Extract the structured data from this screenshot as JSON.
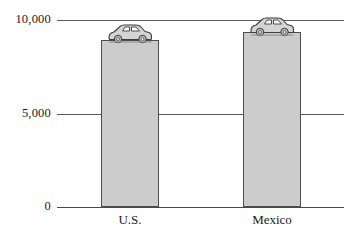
{
  "chart_data": {
    "type": "bar",
    "title": "",
    "subtitle": "",
    "xlabel": "",
    "ylabel": "",
    "categories": [
      "U.S.",
      "Mexico"
    ],
    "values": [
      8950,
      9350
    ],
    "series": [
      {
        "name": "",
        "values": [
          8950,
          9350
        ]
      }
    ],
    "ylim": [
      0,
      10000
    ],
    "yticks": [
      0,
      5000,
      10000
    ],
    "ytick_labels": [
      "0",
      "5,000",
      "10,000"
    ],
    "grid": true,
    "grid_axis": "y",
    "legend": false,
    "legend_position": "none",
    "annotations": [
      {
        "category": "U.S.",
        "icon": "car-icon"
      },
      {
        "category": "Mexico",
        "icon": "car-icon"
      }
    ],
    "colors": {
      "bar_fill": "#cccccc",
      "bar_border": "#4d4d4d",
      "gridline": "#5b5b5b",
      "axis_line": "#4a4a4a",
      "text": "#1a1a1a",
      "background": "#ffffff"
    }
  },
  "axis": {
    "y": {
      "tick_10000": "10,000",
      "tick_5000": "5,000",
      "tick_0": "0"
    },
    "x": {
      "tick_us": "U.S.",
      "tick_mexico": "Mexico"
    }
  },
  "icons": {
    "car_us": "car-icon",
    "car_mexico": "car-icon"
  }
}
